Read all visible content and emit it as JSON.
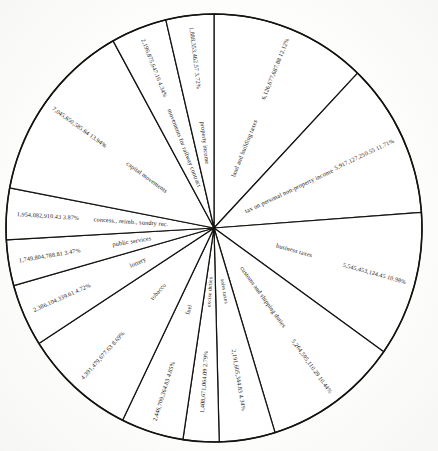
{
  "chart_data": {
    "type": "pie",
    "title": "",
    "subtitle": "",
    "xlabel": "",
    "ylabel": "",
    "legend_position": "none",
    "grid": false,
    "label_format": "amount + percent",
    "total_percent": "100.00%",
    "start_angle_deg": 0,
    "direction": "clockwise",
    "categories": [
      "land and building taxes",
      "tax on personal non-property income",
      "business taxes",
      "customs and shipping duties",
      "sales taxes",
      "excise duties",
      "fuel",
      "tobacco",
      "lottery",
      "public services",
      "concess., reimb., sundry rec.",
      "capital movements",
      "movements for railway contract",
      "property income"
    ],
    "values": [
      12.12,
      11.71,
      10.98,
      10.44,
      4.34,
      2.79,
      4.85,
      8.69,
      4.72,
      3.47,
      3.87,
      13.94,
      4.34,
      3.72
    ],
    "amounts": [
      "6,126,677,687.88",
      "5,917,127,250.55",
      "5,545,453,124.45",
      "5,264,595,110.29",
      "2,191,605,344.83",
      "1,408,671,064.09",
      "2,446,709,364.83",
      "4,391,479,677.63",
      "2,386,104,339.61",
      "1,749,804,788.81",
      "1,954,082,910.43",
      "7,045,650,585.64",
      "2,196,875,647.16",
      "1,888,353,462.57"
    ],
    "percent_labels": [
      "12.12%",
      "11.71%",
      "10.98%",
      "10.44%",
      "4.34%",
      "2.79%",
      "4.85%",
      "8.69%",
      "4.72%",
      "3.47%",
      "3.87%",
      "13.94%",
      "4.34%",
      "3.72%"
    ],
    "slices": [
      {
        "label": "land and building taxes",
        "amount": "6,126,677,687.88",
        "percent": "12.12%",
        "value": 12.12
      },
      {
        "label": "tax on personal non-property income",
        "amount": "5,917,127,250.55",
        "percent": "11.71%",
        "value": 11.71
      },
      {
        "label": "business taxes",
        "amount": "5,545,453,124.45",
        "percent": "10.98%",
        "value": 10.98
      },
      {
        "label": "customs and shipping duties",
        "amount": "5,264,595,110.29",
        "percent": "10.44%",
        "value": 10.44
      },
      {
        "label": "sales taxes",
        "amount": "2,191,605,344.83",
        "percent": "4.34%",
        "value": 4.34
      },
      {
        "label": "excise duties",
        "amount": "1,408,671,064.09",
        "percent": "2.79%",
        "value": 2.79
      },
      {
        "label": "fuel",
        "amount": "2,446,709,364.83",
        "percent": "4.85%",
        "value": 4.85
      },
      {
        "label": "tobacco",
        "amount": "4,391,479,677.63",
        "percent": "8.69%",
        "value": 8.69
      },
      {
        "label": "lottery",
        "amount": "2,386,104,339.61",
        "percent": "4.72%",
        "value": 4.72
      },
      {
        "label": "public services",
        "amount": "1,749,804,788.81",
        "percent": "3.47%",
        "value": 3.47
      },
      {
        "label": "concess., reimb., sundry rec.",
        "amount": "1,954,082,910.43",
        "percent": "3.87%",
        "value": 3.87
      },
      {
        "label": "capital movements",
        "amount": "7,045,650,585.64",
        "percent": "13.94%",
        "value": 13.94
      },
      {
        "label": "movements for railway contract",
        "amount": "2,196,875,647.16",
        "percent": "4.34%",
        "value": 4.34
      },
      {
        "label": "property income",
        "amount": "1,888,353,462.57",
        "percent": "3.72%",
        "value": 3.72
      }
    ],
    "colors": {
      "slice_fill": "#ffffff",
      "outline": "#14130f",
      "text": "#17150f",
      "background": "#fdfdfc"
    }
  },
  "figure": {
    "center_x": 214,
    "center_y": 228,
    "radius": 208
  }
}
